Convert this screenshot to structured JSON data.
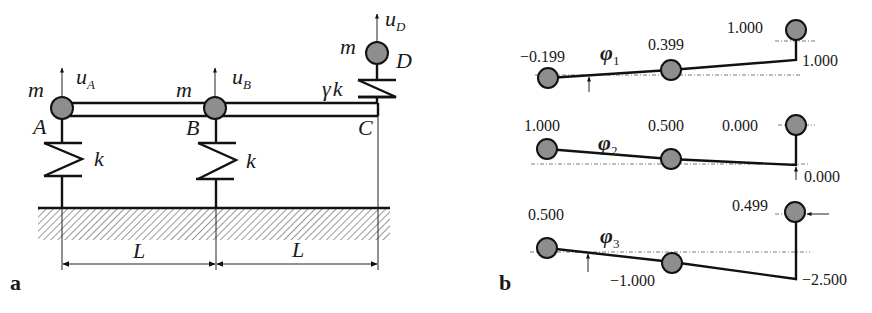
{
  "panel_a": {
    "label": "a",
    "nodes": {
      "A": {
        "name": "A",
        "mass": "m",
        "disp": "u",
        "disp_sub": "A"
      },
      "B": {
        "name": "B",
        "mass": "m",
        "disp": "u",
        "disp_sub": "B"
      },
      "C": {
        "name": "C"
      },
      "D": {
        "name": "D",
        "mass": "m",
        "disp": "u",
        "disp_sub": "D"
      }
    },
    "springs": {
      "A": "k",
      "B": "k",
      "CD_gamma": "γ",
      "CD_k": "k"
    },
    "dimensions": [
      "L",
      "L"
    ]
  },
  "panel_b": {
    "label": "b",
    "modes": [
      {
        "symbol": "φ",
        "index": "1",
        "values": {
          "A": "−0.199",
          "B": "0.399",
          "D": "1.000",
          "C": "1.000"
        }
      },
      {
        "symbol": "φ",
        "index": "2",
        "values": {
          "A": "1.000",
          "B": "0.500",
          "D": "0.000",
          "C": "0.000"
        }
      },
      {
        "symbol": "φ",
        "index": "3",
        "values": {
          "A": "0.500",
          "B": "−1.000",
          "D": "0.499",
          "C": "−2.500"
        }
      }
    ]
  },
  "colors": {
    "node_fill": "#8e8e8e",
    "line": "#111111"
  }
}
